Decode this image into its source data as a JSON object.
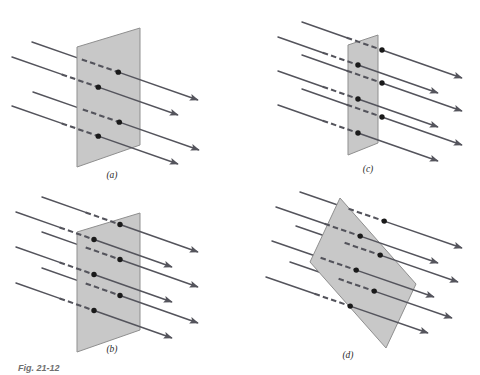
{
  "figure": {
    "caption": "Fig. 21-12",
    "background_color": "#ffffff",
    "plane_fill_color": "#c8c8c8",
    "plane_stroke_color": "#8f8f8f",
    "field_line_color": "#54545c",
    "dot_color": "#1a1a1a",
    "label_color": "#2b2b2b"
  },
  "panels": [
    {
      "id": "panel-a",
      "label": "(a)",
      "label_x": 112,
      "label_y": 178,
      "description": "Vertical plane tilted in perspective with four field lines passing through it",
      "plane": {
        "points": "77,47 140,28 140,145 77,167",
        "shape": "parallelogram"
      },
      "field_lines": [
        {
          "x1": 32,
          "y1": 42,
          "x2": 198,
          "y2": 100,
          "dash_start": 0.3,
          "dash_end": 0.52,
          "dot_t": 0.52,
          "arrow": true
        },
        {
          "x1": 12,
          "y1": 57,
          "x2": 178,
          "y2": 115,
          "dash_start": 0.3,
          "dash_end": 0.52,
          "dot_t": 0.52,
          "arrow": true
        },
        {
          "x1": 33,
          "y1": 92,
          "x2": 199,
          "y2": 150,
          "dash_start": 0.3,
          "dash_end": 0.52,
          "dot_t": 0.52,
          "arrow": true
        },
        {
          "x1": 12,
          "y1": 106,
          "x2": 178,
          "y2": 164,
          "dash_start": 0.3,
          "dash_end": 0.52,
          "dot_t": 0.52,
          "arrow": true
        }
      ],
      "dot_count": 4
    },
    {
      "id": "panel-b",
      "label": "(b)",
      "label_x": 112,
      "label_y": 352,
      "description": "Same vertical plane as panel a but with a denser set of field lines",
      "plane": {
        "points": "77,232 140,213 140,330 77,352",
        "shape": "parallelogram"
      },
      "field_lines": [
        {
          "x1": 42,
          "y1": 197,
          "x2": 198,
          "y2": 252,
          "dash_start": 0.28,
          "dash_end": 0.5,
          "dot_t": 0.5,
          "arrow": true
        },
        {
          "x1": 16,
          "y1": 212,
          "x2": 172,
          "y2": 267,
          "dash_start": 0.28,
          "dash_end": 0.5,
          "dot_t": 0.5,
          "arrow": true
        },
        {
          "x1": 42,
          "y1": 232,
          "x2": 198,
          "y2": 287,
          "dash_start": 0.28,
          "dash_end": 0.5,
          "dot_t": 0.5,
          "arrow": true
        },
        {
          "x1": 16,
          "y1": 247,
          "x2": 172,
          "y2": 302,
          "dash_start": 0.28,
          "dash_end": 0.5,
          "dot_t": 0.5,
          "arrow": true
        },
        {
          "x1": 42,
          "y1": 268,
          "x2": 198,
          "y2": 323,
          "dash_start": 0.28,
          "dash_end": 0.5,
          "dot_t": 0.5,
          "arrow": true
        },
        {
          "x1": 16,
          "y1": 283,
          "x2": 172,
          "y2": 338,
          "dash_start": 0.28,
          "dash_end": 0.5,
          "dot_t": 0.5,
          "arrow": true
        }
      ],
      "dot_count": 6
    },
    {
      "id": "panel-c",
      "label": "(c)",
      "label_x": 368,
      "label_y": 172,
      "description": "Narrow nearly edge-on plane with five field lines grazing through it",
      "plane": {
        "points": "348,45 378,35 378,143 348,155",
        "shape": "parallelogram"
      },
      "field_lines": [
        {
          "x1": 302,
          "y1": 22,
          "x2": 462,
          "y2": 78,
          "dash_start": 0.28,
          "dash_end": 0.5,
          "dot_t": 0.5,
          "arrow": true
        },
        {
          "x1": 278,
          "y1": 37,
          "x2": 438,
          "y2": 93,
          "dash_start": 0.28,
          "dash_end": 0.5,
          "dot_t": 0.5,
          "arrow": true
        },
        {
          "x1": 302,
          "y1": 55,
          "x2": 462,
          "y2": 111,
          "dash_start": 0.28,
          "dash_end": 0.5,
          "dot_t": 0.5,
          "arrow": true
        },
        {
          "x1": 278,
          "y1": 71,
          "x2": 438,
          "y2": 127,
          "dash_start": 0.28,
          "dash_end": 0.5,
          "dot_t": 0.5,
          "arrow": true
        },
        {
          "x1": 302,
          "y1": 89,
          "x2": 462,
          "y2": 145,
          "dash_start": 0.28,
          "dash_end": 0.5,
          "dot_t": 0.5,
          "arrow": true
        },
        {
          "x1": 278,
          "y1": 105,
          "x2": 438,
          "y2": 161,
          "dash_start": 0.28,
          "dash_end": 0.5,
          "dot_t": 0.5,
          "arrow": true
        }
      ],
      "dot_count": 4
    },
    {
      "id": "panel-d",
      "label": "(d)",
      "label_x": 348,
      "label_y": 358,
      "description": "Tilted rhombus plane oriented obliquely to the field lines",
      "plane": {
        "points": "340,198 416,284 386,348 310,262",
        "shape": "rhombus"
      },
      "field_lines": [
        {
          "x1": 300,
          "y1": 192,
          "x2": 462,
          "y2": 248,
          "dash_start": 0.3,
          "dash_end": 0.52,
          "dot_t": 0.52,
          "arrow": true
        },
        {
          "x1": 276,
          "y1": 207,
          "x2": 438,
          "y2": 263,
          "dash_start": 0.3,
          "dash_end": 0.52,
          "dot_t": 0.52,
          "arrow": true
        },
        {
          "x1": 296,
          "y1": 226,
          "x2": 458,
          "y2": 282,
          "dash_start": 0.3,
          "dash_end": 0.52,
          "dot_t": 0.52,
          "arrow": true
        },
        {
          "x1": 272,
          "y1": 241,
          "x2": 434,
          "y2": 297,
          "dash_start": 0.3,
          "dash_end": 0.52,
          "dot_t": 0.52,
          "arrow": true
        },
        {
          "x1": 290,
          "y1": 262,
          "x2": 452,
          "y2": 318,
          "dash_start": 0.3,
          "dash_end": 0.52,
          "dot_t": 0.52,
          "arrow": true
        },
        {
          "x1": 266,
          "y1": 277,
          "x2": 428,
          "y2": 333,
          "dash_start": 0.3,
          "dash_end": 0.52,
          "dot_t": 0.52,
          "arrow": true
        }
      ],
      "dot_count": 4
    }
  ],
  "caption_block": {
    "text": "Fig. 21-12",
    "x": 18,
    "y": 371
  }
}
